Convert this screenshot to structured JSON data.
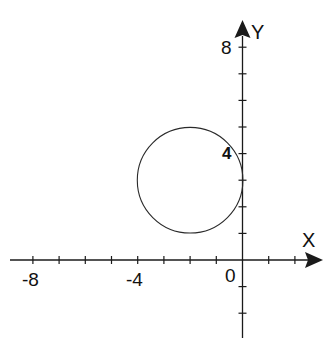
{
  "figure": {
    "colors": {
      "background": "#ffffff",
      "axis": "#1a1a1a",
      "curve": "#2a2a2a",
      "text": "#111111"
    },
    "axes": {
      "x_label": "X",
      "y_label": "Y",
      "x_tick_labels": [
        {
          "value": -8,
          "text": "-8"
        },
        {
          "value": -4,
          "text": "-4"
        },
        {
          "value": 0,
          "text": "0"
        }
      ],
      "y_tick_labels": [
        {
          "value": 8,
          "text": "8"
        },
        {
          "value": 4,
          "text": "4"
        }
      ],
      "x_ticks": [
        -8,
        -7,
        -6,
        -5,
        -4,
        -3,
        -2,
        -1,
        1,
        2
      ],
      "y_ticks": [
        8,
        7,
        6,
        5,
        4,
        3,
        2,
        1,
        -1,
        -2
      ],
      "x_range": [
        -9,
        3
      ],
      "y_range": [
        -3,
        9
      ]
    },
    "circle": {
      "center": [
        -2,
        3
      ],
      "radius": 2
    }
  },
  "chart_data": {
    "type": "scatter",
    "title": "",
    "xlabel": "X",
    "ylabel": "Y",
    "xlim": [
      -9,
      3
    ],
    "ylim": [
      -3,
      9
    ],
    "x_tick_labels": [
      "-8",
      "-4",
      "0"
    ],
    "y_tick_labels": [
      "8",
      "4"
    ],
    "grid": false,
    "legend": null,
    "series": [
      {
        "name": "circle",
        "shape": "circle",
        "equation": "(x+2)^2 + (y-3)^2 = 4",
        "center": [
          -2,
          3
        ],
        "radius": 2
      }
    ]
  }
}
